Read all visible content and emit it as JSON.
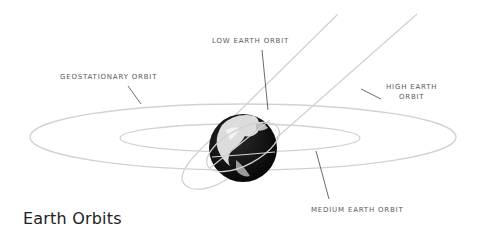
{
  "title": "Earth Orbits",
  "labels": {
    "geostationary": "GEOSTATIONARY ORBIT",
    "low_earth": "LOW EARTH ORBIT",
    "high_earth_line1": "HIGH EARTH",
    "high_earth_line2": "ORBIT",
    "medium_earth": "MEDIUM EARTH ORBIT"
  },
  "colors": {
    "orbit": "#cfcfcf",
    "leader": "#444444",
    "text": "#5a5a5a",
    "title": "#222222",
    "globe_dark": "#111111",
    "globe_light": "#e8e8e8"
  }
}
